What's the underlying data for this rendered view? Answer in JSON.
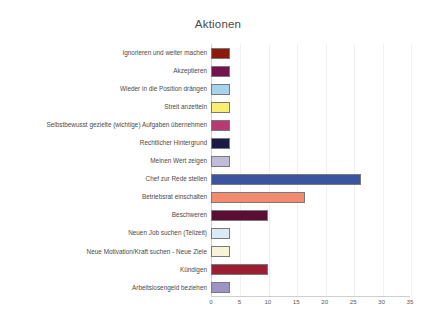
{
  "chart_data": {
    "type": "bar",
    "orientation": "horizontal",
    "title": "Aktionen",
    "xlabel": "",
    "ylabel": "",
    "xlim": [
      0,
      35
    ],
    "xticks": [
      0,
      5,
      10,
      15,
      20,
      25,
      30,
      35
    ],
    "grid": true,
    "legend": "none",
    "categories": [
      "Ignorieren und weiter machen",
      "Akzeptieren",
      "Wieder in die Position drängen",
      "Streit anzetteln",
      "Selbstbewusst gezielte (wichtige) Aufgaben übernehmen",
      "Rechtlicher Hintergrund",
      "Meinen Wert zeigen",
      "Chef zur Rede stellen",
      "Betriebsrat einschalten",
      "Beschweren",
      "Neuen Job suchen (Teilzeit)",
      "Neue Motivation/Kraft suchen - Neue Ziele",
      "Kündigen",
      "Arbeitslosengeld beziehen"
    ],
    "values": [
      3.3,
      3.3,
      3.3,
      3.3,
      3.3,
      3.3,
      3.3,
      26.3,
      16.5,
      10,
      3.3,
      3.3,
      10,
      3.3
    ],
    "colors": [
      "#8c1a0c",
      "#73124f",
      "#a6d4ec",
      "#f6ef72",
      "#b83a73",
      "#1b1a47",
      "#c2bcd8",
      "#3a54a0",
      "#f48b6e",
      "#5a0e33",
      "#dceaf6",
      "#f7f3d6",
      "#9b1f33",
      "#9f93c4"
    ],
    "bar_edge_color": "#7a7a7a",
    "axis_color": "#cfcfcf",
    "gridline_color": "#f0f0f0",
    "background": "#ffffff"
  }
}
